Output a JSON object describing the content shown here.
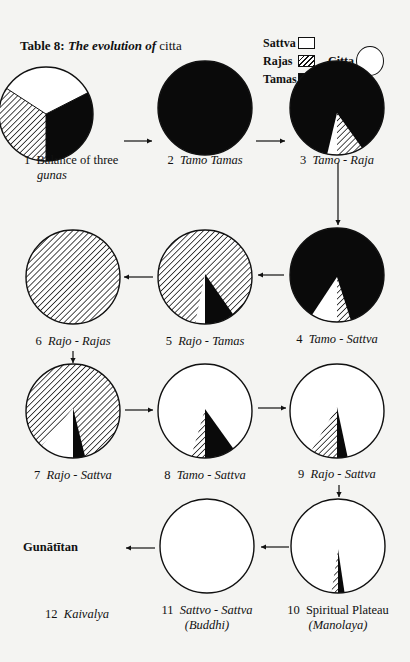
{
  "page": {
    "title_prefix": "Table 8:",
    "title_italic": "The evolution of",
    "title_plain": "citta"
  },
  "chart_data": {
    "type": "pie",
    "title": "Table 8: The evolution of citta",
    "legend": {
      "placement": "top-right",
      "entries": [
        {
          "name": "Sattva",
          "fill": "white"
        },
        {
          "name": "Rajas",
          "fill": "hatched"
        },
        {
          "name": "Tamas",
          "fill": "black"
        },
        {
          "name": "Citta",
          "fill": "circle-outline"
        }
      ]
    },
    "colors": {
      "sattva": "#ffffff",
      "tamas": "#0a0a0a",
      "rajas_hatch": "#111111",
      "outline": "#111111"
    },
    "pies": [
      {
        "id": 1,
        "number": "1",
        "label": "Balance of three",
        "label_line2": "gunas",
        "label_italic": false,
        "line2_italic": true,
        "slices": [
          {
            "guna": "sattva",
            "from_deg": -57,
            "to_deg": 63
          },
          {
            "guna": "tamas",
            "from_deg": 63,
            "to_deg": 180
          },
          {
            "guna": "rajas",
            "from_deg": 180,
            "to_deg": 303
          }
        ]
      },
      {
        "id": 2,
        "number": "2",
        "label": "Tamo Tamas",
        "label_italic": true,
        "slices": [
          {
            "guna": "tamas",
            "from_deg": 0,
            "to_deg": 360
          }
        ]
      },
      {
        "id": 3,
        "number": "3",
        "label": "Tamo - Raja",
        "label_italic": true,
        "slices": [
          {
            "guna": "tamas",
            "from_deg": 0,
            "to_deg": 360
          },
          {
            "guna": "rajas",
            "from_deg": 148,
            "to_deg": 180
          },
          {
            "guna": "sattva",
            "from_deg": 180,
            "to_deg": 192
          }
        ]
      },
      {
        "id": 4,
        "number": "4",
        "label": "Tamo - Sattva",
        "label_italic": true,
        "slices": [
          {
            "guna": "tamas",
            "from_deg": 0,
            "to_deg": 360
          },
          {
            "guna": "rajas",
            "from_deg": 163,
            "to_deg": 180
          },
          {
            "guna": "sattva",
            "from_deg": 180,
            "to_deg": 212
          }
        ]
      },
      {
        "id": 5,
        "number": "5",
        "label": "Rajo - Tamas",
        "label_italic": true,
        "slices": [
          {
            "guna": "rajas",
            "from_deg": 0,
            "to_deg": 360
          },
          {
            "guna": "tamas",
            "from_deg": 143,
            "to_deg": 180
          },
          {
            "guna": "sattva",
            "from_deg": 180,
            "to_deg": 192
          }
        ]
      },
      {
        "id": 6,
        "number": "6",
        "label": "Rajo - Rajas",
        "label_italic": true,
        "slices": [
          {
            "guna": "rajas",
            "from_deg": 0,
            "to_deg": 360
          }
        ]
      },
      {
        "id": 7,
        "number": "7",
        "label": "Rajo - Sattva",
        "label_italic": true,
        "slices": [
          {
            "guna": "rajas",
            "from_deg": 0,
            "to_deg": 360
          },
          {
            "guna": "tamas",
            "from_deg": 165,
            "to_deg": 180
          },
          {
            "guna": "sattva",
            "from_deg": 180,
            "to_deg": 222
          }
        ]
      },
      {
        "id": 8,
        "number": "8",
        "label": "Tamo - Sattva",
        "label_italic": true,
        "slices": [
          {
            "guna": "sattva",
            "from_deg": 0,
            "to_deg": 360
          },
          {
            "guna": "tamas",
            "from_deg": 143,
            "to_deg": 180
          },
          {
            "guna": "rajas",
            "from_deg": 180,
            "to_deg": 197
          }
        ]
      },
      {
        "id": 9,
        "number": "9",
        "label": "Rajo - Sattva",
        "label_italic": true,
        "slices": [
          {
            "guna": "sattva",
            "from_deg": 0,
            "to_deg": 360
          },
          {
            "guna": "tamas",
            "from_deg": 167,
            "to_deg": 180
          },
          {
            "guna": "rajas",
            "from_deg": 180,
            "to_deg": 213
          }
        ]
      },
      {
        "id": 10,
        "number": "10",
        "label": "Spiritual Plateau",
        "label_line2": "(Manolaya)",
        "label_italic": false,
        "line2_italic": true,
        "slices": [
          {
            "guna": "sattva",
            "from_deg": 0,
            "to_deg": 360
          },
          {
            "guna": "tamas",
            "from_deg": 172,
            "to_deg": 180
          },
          {
            "guna": "rajas",
            "from_deg": 180,
            "to_deg": 188
          }
        ]
      },
      {
        "id": 11,
        "number": "11",
        "label": "Sattvo - Sattva",
        "label_line2": "(Buddhi)",
        "label_italic": true,
        "line2_italic": true,
        "slices": [
          {
            "guna": "sattva",
            "from_deg": 0,
            "to_deg": 360
          }
        ]
      },
      {
        "id": 12,
        "number": "12",
        "label": "Kaivalya",
        "label_italic": true,
        "above_text": "Gunātītan",
        "slices": []
      }
    ],
    "flow": [
      "1→2",
      "2→3",
      "3→4",
      "4→5",
      "5→6",
      "6→7",
      "7→8",
      "8→9",
      "9→10",
      "10→11",
      "11→12"
    ]
  }
}
